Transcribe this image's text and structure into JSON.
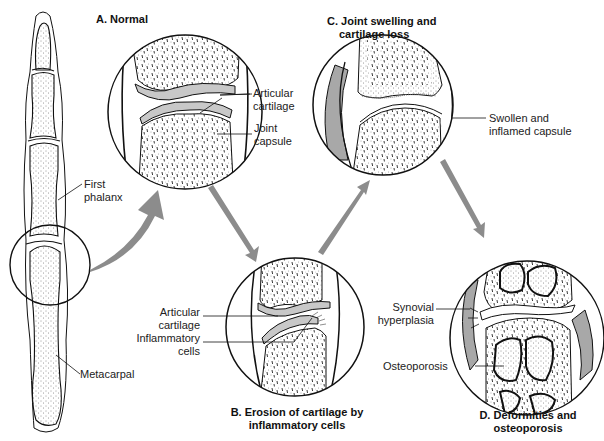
{
  "diagram": {
    "colors": {
      "line": "#111111",
      "cartilage": "#c8c8c8",
      "arrow": "#8c8c8c",
      "capsule_swollen": "#a8a8a8",
      "background": "#ffffff"
    },
    "finger": {
      "labels": {
        "first_phalanx": "First\nphalanx",
        "metacarpal": "Metacarpal"
      },
      "first_phalanx_line1": "First",
      "first_phalanx_line2": "phalanx",
      "metacarpal": "Metacarpal"
    },
    "panels": [
      {
        "id": "A",
        "title": "A. Normal",
        "labels": [
          {
            "line1": "Articular",
            "line2": "cartilage"
          },
          {
            "line1": "Joint",
            "line2": "capsule"
          }
        ]
      },
      {
        "id": "B",
        "title_line1": "B. Erosion of cartilage by",
        "title_line2": "inflammatory cells",
        "labels": [
          {
            "line1": "Articular",
            "line2": "cartilage"
          },
          {
            "line1": "Inflammatory",
            "line2": "cells"
          }
        ]
      },
      {
        "id": "C",
        "title_line1": "C. Joint swelling and",
        "title_line2": "cartilage loss",
        "labels": [
          {
            "line1": "Swollen and",
            "line2": "inflamed capsule"
          }
        ]
      },
      {
        "id": "D",
        "title_line1": "D. Deformities and",
        "title_line2": "osteoporosis",
        "labels": [
          {
            "line1": "Synovial",
            "line2": "hyperplasia"
          },
          {
            "line1": "Osteoporosis"
          }
        ]
      }
    ],
    "flow": [
      "finger",
      "A",
      "B",
      "C",
      "D"
    ]
  }
}
